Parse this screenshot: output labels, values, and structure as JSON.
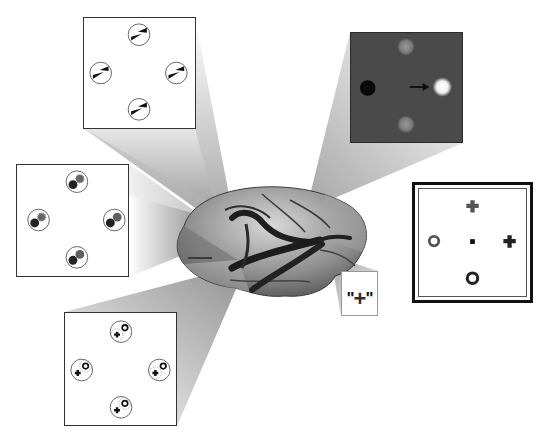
{
  "figure": {
    "colors": {
      "background": "#ffffff",
      "beam": "#d0d0d0",
      "brain": "#8a8a8a",
      "dark_panel": "#4a4a4a",
      "panel_border": "#333333"
    }
  },
  "panels": {
    "top_left": {
      "name": "arrow-pair stimulus array",
      "items": [
        "circle with two black wedges",
        "circle with two black wedges",
        "circle with two black wedges",
        "circle with two black wedges"
      ],
      "positions": [
        "top",
        "left",
        "right",
        "bottom"
      ]
    },
    "middle_left": {
      "name": "dot-pair stimulus array",
      "items": [
        "black dot + gray starburst dot",
        "black dot + gray starburst dot",
        "black dot + gray dot",
        "black dot + gray dot"
      ],
      "positions": [
        "top",
        "left",
        "right",
        "bottom"
      ]
    },
    "bottom_left": {
      "name": "cross-ring stimulus array",
      "items": [
        "starburst cross + ring",
        "cross + starburst ring",
        "starburst cross + ring",
        "cross + starburst ring"
      ],
      "positions": [
        "top",
        "left",
        "right",
        "bottom"
      ]
    },
    "top_right": {
      "name": "saccade target display",
      "items": [
        "black fixation dot (left)",
        "bright target (right)",
        "dim target (top)",
        "dim target (bottom)"
      ],
      "arrow": "right-arrow"
    },
    "right": {
      "name": "symbol choice display",
      "items": [
        "cross (top)",
        "ring (left)",
        "fixation square (center)",
        "cross (right)",
        "ring (bottom)"
      ]
    }
  },
  "label_box": {
    "open_quote": "\"",
    "symbol": "+",
    "close_quote": "\""
  }
}
